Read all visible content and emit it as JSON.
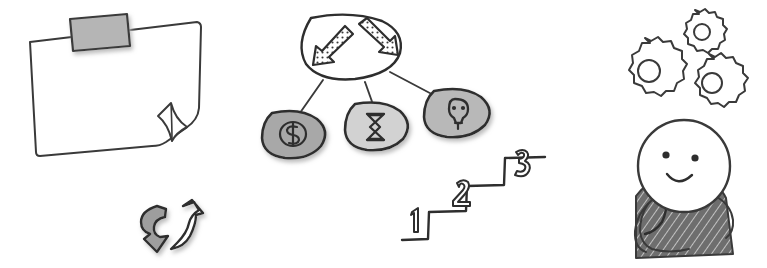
{
  "canvas": {
    "width": 767,
    "height": 268,
    "background": "#ffffff",
    "style": "hand-drawn sketch",
    "ink_color": "#3a3a3a",
    "ink_color_dark": "#2e2e2e"
  },
  "palette": {
    "ink": "#3a3a3a",
    "tape_fill": "#b5b5b5",
    "node_fill_dark": "#a8a8a8",
    "node_fill_light": "#d2d2d2",
    "node_fill_mid": "#b8b8b8",
    "arrow_gray_fill": "#9e9e9e",
    "arrow_white_fill": "#ffffff",
    "body_shading": "#6e6e6e",
    "shadow": "#cfcfcf",
    "white": "#ffffff"
  },
  "elements": {
    "paper_note": {
      "name": "taped paper note",
      "label": "Blank taped paper with curled corner",
      "tape": {
        "label": "Tape strip",
        "fill": "#b5b5b5"
      },
      "curl": {
        "label": "Curled page corner"
      }
    },
    "cycle_arrows": {
      "name": "cycle arrows",
      "label": "Two curved cycle arrows",
      "down_arrow": {
        "label": "Curved arrow pointing down",
        "fill": "#9e9e9e"
      },
      "up_arrow": {
        "label": "Curved arrow pointing up",
        "fill": "#ffffff"
      }
    },
    "tree_diagram": {
      "name": "decision tree",
      "label": "Branching tree diagram with three outcome nodes",
      "root": {
        "label": "Root node with two diverging arrows",
        "fill": "#ffffff",
        "icon_left": "arrow-down-left-icon",
        "icon_right": "arrow-down-right-icon"
      },
      "nodes": [
        {
          "icon": "dollar-icon",
          "label": "Cost",
          "fill": "#a8a8a8"
        },
        {
          "icon": "hourglass-icon",
          "label": "Time",
          "fill": "#d2d2d2"
        },
        {
          "icon": "lightbulb-icon",
          "label": "Idea",
          "fill": "#b8b8b8"
        }
      ]
    },
    "staircase": {
      "name": "staircase steps",
      "label": "Three numbered ascending steps",
      "steps": [
        {
          "number": "1"
        },
        {
          "number": "2"
        },
        {
          "number": "3"
        }
      ]
    },
    "gears": {
      "name": "gear cluster",
      "label": "Three interlocking gears",
      "items": [
        {
          "icon": "gear-icon",
          "size": "small"
        },
        {
          "icon": "gear-icon",
          "size": "large"
        },
        {
          "icon": "gear-icon",
          "size": "medium"
        }
      ]
    },
    "thinker": {
      "name": "thinking person",
      "label": "Smiling person in thinking pose",
      "face": {
        "label": "Round face",
        "eye_left": "eye-dot",
        "eye_right": "eye-dot",
        "mouth": "smile-curve"
      },
      "body": {
        "label": "Shaded torso",
        "shading": "#6e6e6e"
      },
      "arm": {
        "label": "Arm raised with hand to chin"
      }
    }
  }
}
